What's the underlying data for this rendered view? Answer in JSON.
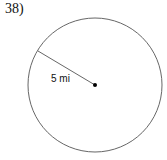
{
  "question": {
    "number_label": "38)"
  },
  "figure": {
    "type": "circle",
    "radius_label": "5 mi",
    "center": [
      95,
      85
    ],
    "radius_px": 67,
    "radius_end": [
      38,
      51
    ]
  }
}
